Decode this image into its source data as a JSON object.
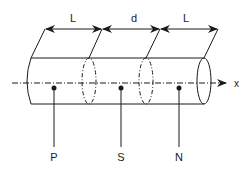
{
  "diagram": {
    "dimension_labels": {
      "left_length": "L",
      "gap": "d",
      "right_length": "L"
    },
    "axis_label": "x",
    "points": [
      {
        "label": "P",
        "x": 54
      },
      {
        "label": "S",
        "x": 121
      },
      {
        "label": "N",
        "x": 179
      }
    ],
    "colors": {
      "stroke": "#1a1a1a",
      "background": "#ffffff"
    }
  }
}
